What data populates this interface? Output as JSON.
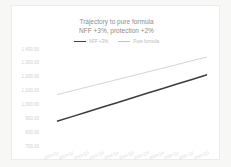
{
  "chart_data": {
    "type": "line",
    "title": "Trajectory to pure formula",
    "subtitle": "NFF +3%, protection +2%",
    "categories": [
      "2023-Q1",
      "2023-Q2",
      "2023-Q3",
      "2023-Q4",
      "2024-Q1",
      "2024-Q2",
      "2024-Q3",
      "2024-Q4",
      "2025-Q1",
      "2025-Q2",
      "2025-Q3"
    ],
    "series": [
      {
        "name": "NFF +3%",
        "color": "#3d3d3d",
        "stroke_width": 1.5,
        "values": [
          871,
          905,
          938,
          972,
          1005,
          1039,
          1073,
          1106,
          1140,
          1173,
          1207
        ]
      },
      {
        "name": "Pure formula",
        "color": "#c2c2c2",
        "stroke_width": 0.7,
        "values": [
          1064,
          1091,
          1118,
          1145,
          1172,
          1199,
          1226,
          1253,
          1280,
          1308,
          1335
        ]
      }
    ],
    "xlabel": "",
    "ylabel": "",
    "ylim": [
      700,
      1400
    ],
    "ytick_labels": [
      "1,400.00",
      "1,300.00",
      "1,200.00",
      "1,100.00",
      "1,000.00",
      "900.00",
      "800.00",
      "700.00"
    ],
    "grid": false,
    "legend_position": "top"
  }
}
